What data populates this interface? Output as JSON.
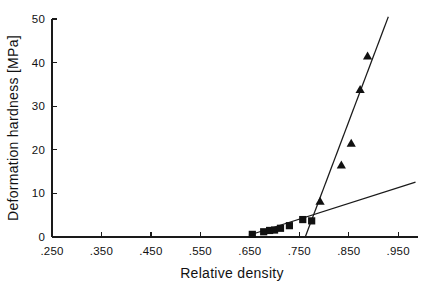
{
  "chart_data": {
    "type": "scatter",
    "title": "",
    "xlabel": "Relative density",
    "ylabel": "Deformation hardness [MPa]",
    "xlim": [
      0.25,
      0.99
    ],
    "ylim": [
      0,
      50
    ],
    "grid": false,
    "legend": "none",
    "x_ticks": [
      0.25,
      0.35,
      0.45,
      0.55,
      0.65,
      0.75,
      0.85,
      0.95
    ],
    "x_tick_labels": [
      ".250",
      ".350",
      ".450",
      ".550",
      ".650",
      ".750",
      ".850",
      ".950"
    ],
    "y_ticks": [
      0,
      10,
      20,
      30,
      40,
      50
    ],
    "y_tick_labels": [
      "0",
      "10",
      "20",
      "30",
      "40",
      "50"
    ],
    "series": [
      {
        "name": "low-density series",
        "marker": "square",
        "x": [
          0.655,
          0.678,
          0.69,
          0.7,
          0.712,
          0.73,
          0.757,
          0.775
        ],
        "y": [
          0.6,
          1.2,
          1.5,
          1.6,
          2.0,
          2.6,
          4.0,
          3.7
        ]
      },
      {
        "name": "high-density series",
        "marker": "triangle",
        "x": [
          0.792,
          0.835,
          0.855,
          0.873,
          0.888
        ],
        "y": [
          8.2,
          16.5,
          21.5,
          33.8,
          41.5
        ]
      }
    ],
    "fit_lines": [
      {
        "name": "shallow-fit-line",
        "x": [
          0.648,
          0.985
        ],
        "y": [
          0.4,
          12.6
        ]
      },
      {
        "name": "steep-fit-line",
        "x": [
          0.762,
          0.93
        ],
        "y": [
          0.0,
          50.5
        ]
      }
    ]
  }
}
